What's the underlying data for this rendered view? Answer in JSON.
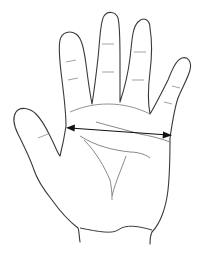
{
  "diagram": {
    "annotation": "palm-width-measurement-arrow",
    "colors": {
      "background": "#ffffff",
      "outline": "#3a3a3a",
      "palm_lines": "#6a6a6a",
      "arrow": "#111111"
    },
    "arrow": {
      "x1": 68,
      "y1": 128,
      "x2": 170,
      "y2": 135,
      "heads": "both"
    }
  }
}
